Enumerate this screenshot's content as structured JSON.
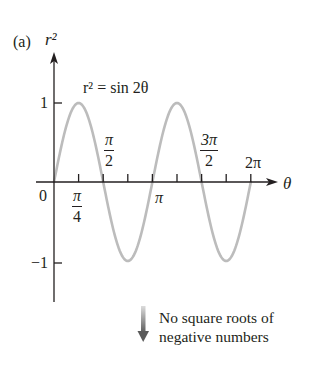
{
  "panel_label": "(a)",
  "y_axis_label": "r²",
  "x_axis_label": "θ",
  "equation": "r² = sin 2θ",
  "y_ticks": [
    {
      "label": "1",
      "value": 1
    },
    {
      "label": "−1",
      "value": -1
    }
  ],
  "origin_label": "0",
  "x_tick_labels": {
    "pi_over_4": {
      "num": "π",
      "den": "4"
    },
    "pi_over_2": {
      "num": "π",
      "den": "2"
    },
    "pi": "π",
    "three_pi_over_2": {
      "num": "3π",
      "den": "2"
    },
    "two_pi": "2π"
  },
  "annotation": {
    "line1": "No square roots of",
    "line2": "negative numbers"
  },
  "colors": {
    "curve": "#bcbcbc",
    "axis": "#231f20",
    "arrow_top": "#d8d8d8",
    "arrow_bottom": "#555555"
  },
  "chart_data": {
    "type": "line",
    "title": "r² = sin 2θ",
    "panel": "(a)",
    "xlabel": "θ",
    "ylabel": "r²",
    "x": [
      0,
      0.3927,
      0.7854,
      1.1781,
      1.5708,
      1.9635,
      2.3562,
      2.7489,
      3.1416,
      3.5343,
      3.927,
      4.3197,
      4.7124,
      5.1051,
      5.4978,
      5.8905,
      6.2832
    ],
    "series": [
      {
        "name": "r² = sin 2θ",
        "values": [
          0,
          0.707,
          1,
          0.707,
          0,
          -0.707,
          -1,
          -0.707,
          0,
          0.707,
          1,
          0.707,
          0,
          -0.707,
          -1,
          -0.707,
          0
        ]
      }
    ],
    "x_ticks": [
      "0",
      "π/4",
      "π/2",
      "3π/4",
      "π",
      "5π/4",
      "3π/2",
      "7π/4",
      "2π"
    ],
    "x_tick_labels_shown": [
      "0",
      "π/4",
      "π/2",
      "π",
      "3π/2",
      "2π"
    ],
    "y_ticks": [
      -1,
      1
    ],
    "xlim": [
      0,
      6.2832
    ],
    "ylim": [
      -1.5,
      1.6
    ],
    "grid": false,
    "legend": "none",
    "annotations": [
      "r² = sin 2θ",
      "No square roots of negative numbers"
    ]
  }
}
